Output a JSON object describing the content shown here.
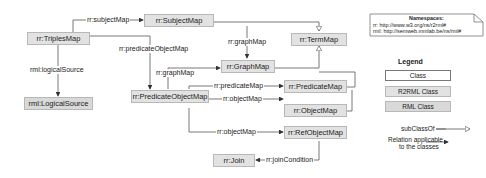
{
  "nodes": {
    "triples_map": "rr:TriplesMap",
    "subject_map": "rr:SubjectMap",
    "term_map": "rr:TermMap",
    "graph_map": "rr:GraphMap",
    "logical_source": "rml:LogicalSource",
    "predicate_object_map": "rr:PredicateObjectMap",
    "predicate_map": "rr:PredicateMap",
    "object_map": "rr:ObjectMap",
    "ref_object_map": "rr:RefObjectMap",
    "join": "rr:Join"
  },
  "edges": {
    "subject_map": "rr:subjectMap",
    "predicate_object_map": "rr:predicateObjectMap",
    "logical_source": "rml:logicalSource",
    "graph_map_from_subject": "rr:graphMap",
    "graph_map_from_pom": "rr:graphMap",
    "predicate_map": "rr:predicateMap",
    "object_map_1": "rr:objectMap",
    "object_map_2": "rr:objectMap",
    "join_condition": "rr:joinCondition"
  },
  "namespaces": {
    "title": "Namespaces:",
    "rr": "rr:  http://www.w3.org/ns/r2rml#",
    "rml": "rml: http://semweb.mmlab.be/ns/rml#"
  },
  "legend": {
    "title": "Legend",
    "class": "Class",
    "r2rml_class": "R2RML Class",
    "rml_class": "RML Class",
    "subclass_of": "subClassOf",
    "relation_line1": "Relation applicable",
    "relation_line2": "to the classes"
  },
  "colors": {
    "r2rml_fill": "#e2e2e2",
    "rml_fill": "#d9d9d9",
    "line": "#555555"
  }
}
